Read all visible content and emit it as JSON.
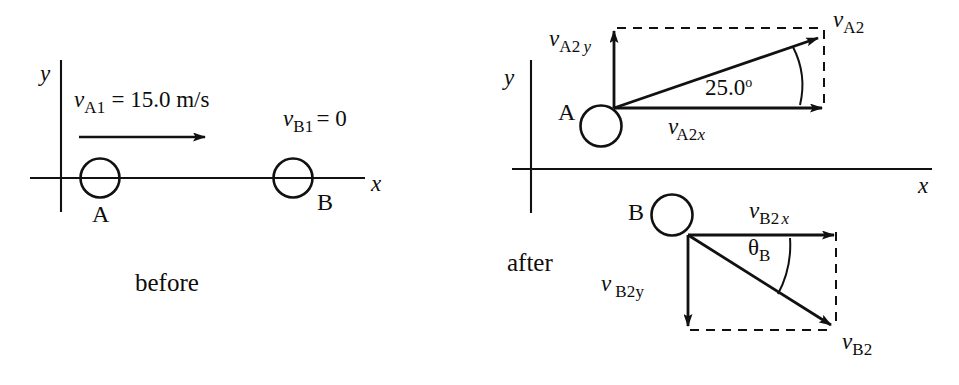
{
  "figure": {
    "title_alt": "Two-dimensional collision of pucks A and B, before and after",
    "stroke_color": "#111111",
    "background_color": "#ffffff"
  },
  "before": {
    "phase_label": "before",
    "axes": {
      "x_label": "x",
      "y_label": "y"
    },
    "body_a": {
      "label": "A",
      "velocity_symbol": "v",
      "velocity_subscript": "A1",
      "velocity_equation": "= 15.0 m/s"
    },
    "body_b": {
      "label": "B",
      "velocity_symbol": "v",
      "velocity_subscript": "B1",
      "velocity_equation": "= 0"
    }
  },
  "after": {
    "phase_label": "after",
    "axes": {
      "x_label": "x",
      "y_label": "y"
    },
    "body_a": {
      "label": "A",
      "resultant": {
        "symbol": "v",
        "subscript": "A2"
      },
      "x_component": {
        "symbol": "v",
        "subscript": "A2",
        "subscript_italic": "x"
      },
      "y_component": {
        "symbol": "v",
        "subscript": "A2",
        "subscript_italic": "y"
      },
      "angle": {
        "value": "25.0",
        "degree_mark": "o"
      }
    },
    "body_b": {
      "label": "B",
      "resultant": {
        "symbol": "v",
        "subscript": "B2"
      },
      "x_component": {
        "symbol": "v",
        "subscript": "B2",
        "subscript_italic": "x"
      },
      "y_component": {
        "symbol": "v",
        "subscript": "B2y"
      },
      "angle": {
        "symbol": "θ",
        "subscript": "B"
      }
    }
  }
}
